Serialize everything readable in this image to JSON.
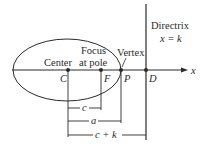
{
  "diagram": {
    "labels": {
      "center": "Center",
      "focus_line1": "Focus",
      "focus_line2": "at pole",
      "vertex": "Vertex",
      "directrix_title": "Directrix",
      "directrix_eq": "x = k",
      "axis_x": "x"
    },
    "points": {
      "C": "C",
      "F": "F",
      "P": "P",
      "D": "D"
    },
    "dimensions": {
      "c": "c",
      "a": "a",
      "c_plus_k": "c + k"
    },
    "colors": {
      "stroke": "#2a2a2a",
      "background": "#ffffff"
    }
  }
}
